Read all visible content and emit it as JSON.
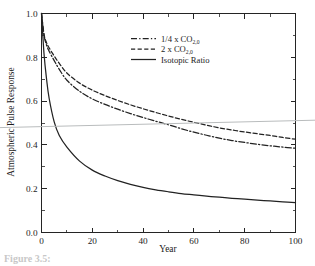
{
  "figure": {
    "caption_fragment": "Figure 3.5:",
    "background_color": "#ffffff",
    "ink_color": "#222222",
    "artifact_color": "#b9bcbd"
  },
  "chart_data": {
    "type": "line",
    "title": "",
    "subtitle": "",
    "xlabel": "Year",
    "ylabel": "Atmospheric Pulse Response",
    "xlim": [
      0,
      100
    ],
    "ylim": [
      0.0,
      1.0
    ],
    "grid": false,
    "legend_position": "upper-center-right",
    "x_ticks": [
      0,
      20,
      40,
      60,
      80,
      100
    ],
    "x_tick_labels": [
      "0",
      "20",
      "40",
      "60",
      "80",
      "100"
    ],
    "x_minor_ticks": [
      10,
      30,
      50,
      70,
      90
    ],
    "y_ticks": [
      0.0,
      0.2,
      0.4,
      0.6,
      0.8,
      1.0
    ],
    "y_tick_labels": [
      "0.0",
      "0.2",
      "0.4",
      "0.6",
      "0.8",
      "1.0"
    ],
    "y_minor_ticks": [
      0.1,
      0.3,
      0.5,
      0.7,
      0.9
    ],
    "x": [
      0,
      1,
      2,
      3,
      5,
      7,
      10,
      15,
      20,
      25,
      30,
      35,
      40,
      45,
      50,
      55,
      60,
      65,
      70,
      75,
      80,
      85,
      90,
      95,
      100
    ],
    "series": [
      {
        "name": "1/4 x CO2,0",
        "label_main": "1/4 x CO",
        "label_sub": "2,0",
        "style": "dash-dot",
        "color": "#222222",
        "values": [
          1.0,
          0.9,
          0.855,
          0.828,
          0.785,
          0.745,
          0.695,
          0.645,
          0.61,
          0.585,
          0.563,
          0.543,
          0.525,
          0.508,
          0.492,
          0.474,
          0.458,
          0.444,
          0.431,
          0.42,
          0.411,
          0.403,
          0.396,
          0.39,
          0.385
        ]
      },
      {
        "name": "2 x CO2,0",
        "label_main": "2 x CO",
        "label_sub": "2,0",
        "style": "dashed",
        "color": "#222222",
        "values": [
          1.0,
          0.905,
          0.866,
          0.843,
          0.806,
          0.772,
          0.728,
          0.682,
          0.65,
          0.625,
          0.603,
          0.583,
          0.565,
          0.548,
          0.532,
          0.517,
          0.503,
          0.49,
          0.478,
          0.468,
          0.459,
          0.451,
          0.443,
          0.434,
          0.426
        ]
      },
      {
        "name": "Isotopic Ratio",
        "label_main": "Isotopic Ratio",
        "label_sub": "",
        "style": "solid",
        "color": "#222222",
        "values": [
          1.0,
          0.815,
          0.7,
          0.613,
          0.505,
          0.443,
          0.39,
          0.326,
          0.285,
          0.258,
          0.237,
          0.22,
          0.206,
          0.195,
          0.186,
          0.178,
          0.172,
          0.166,
          0.161,
          0.156,
          0.152,
          0.148,
          0.144,
          0.14,
          0.136
        ]
      }
    ]
  }
}
